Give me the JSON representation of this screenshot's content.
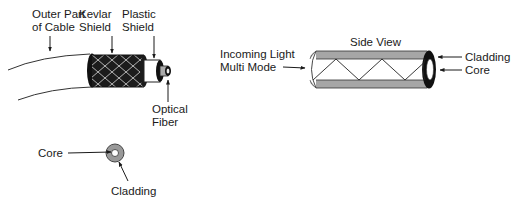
{
  "cable": {
    "labels": {
      "outer_line1": "Outer Part",
      "outer_line2": "of Cable",
      "kevlar_line1": "Kevlar",
      "kevlar_line2": "Shield",
      "plastic_line1": "Plastic",
      "plastic_line2": "Shield",
      "fiber_line1": "Optical",
      "fiber_line2": "Fiber"
    }
  },
  "cross_section": {
    "core_label": "Core",
    "cladding_label": "Cladding"
  },
  "side_view": {
    "title": "Side View",
    "incoming_line1": "Incoming Light",
    "incoming_line2": "Multi Mode",
    "cladding_label": "Cladding",
    "core_label": "Core"
  },
  "colors": {
    "line": "#1a1a1a",
    "cladding_gray": "#9a9a9a",
    "dark": "#111111"
  }
}
